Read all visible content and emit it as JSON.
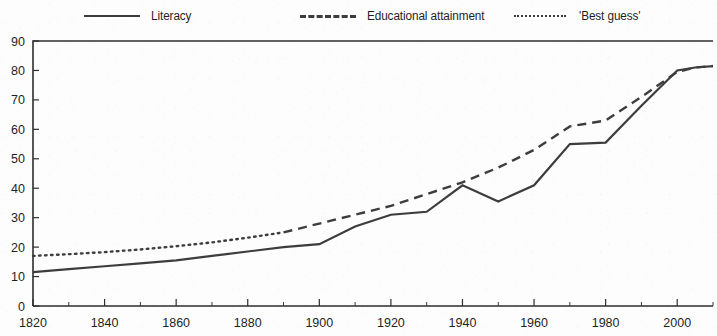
{
  "legend": {
    "items": [
      {
        "label": "Literacy",
        "style": "solid",
        "icon": "solid-line-swatch"
      },
      {
        "label": "Educational attainment",
        "style": "dashed",
        "icon": "dashed-line-swatch"
      },
      {
        "label": "'Best guess'",
        "style": "dotted",
        "icon": "dotted-line-swatch"
      }
    ]
  },
  "chart_data": {
    "type": "line",
    "title": "",
    "subtitle": "",
    "xlabel": "",
    "ylabel": "",
    "xlim": [
      1820,
      2010
    ],
    "ylim": [
      0,
      90
    ],
    "grid": false,
    "legend_position": "top",
    "y_ticks": [
      0,
      10,
      20,
      30,
      40,
      50,
      60,
      70,
      80,
      90
    ],
    "y_tick_labels": [
      "0",
      "10",
      "20",
      "30",
      "40",
      "50",
      "60",
      "70",
      "80",
      "90"
    ],
    "x_ticks": [
      1820,
      1840,
      1860,
      1880,
      1900,
      1920,
      1940,
      1960,
      1980,
      2000
    ],
    "x_tick_labels": [
      "1820",
      "1840",
      "1860",
      "1880",
      "1900",
      "1920",
      "1940",
      "1960",
      "1980",
      "2000"
    ],
    "x_minor_tick_step": 10,
    "series": [
      {
        "name": "Literacy",
        "style": "solid",
        "x": [
          1820,
          1830,
          1840,
          1850,
          1860,
          1870,
          1880,
          1890,
          1900,
          1910,
          1920,
          1930,
          1940,
          1950,
          1960,
          1970,
          1980,
          1990,
          2000,
          2005,
          2010
        ],
        "values": [
          11.5,
          12.5,
          13.5,
          14.5,
          15.5,
          17,
          18.5,
          20,
          21,
          27,
          31,
          32,
          41,
          35.5,
          41,
          55,
          55.5,
          68,
          80,
          81,
          81.5
        ]
      },
      {
        "name": "Educational attainment",
        "style": "dashed",
        "x": [
          1890,
          1900,
          1910,
          1920,
          1930,
          1940,
          1950,
          1960,
          1970,
          1980,
          1990,
          2000,
          2005,
          2010
        ],
        "values": [
          25,
          28,
          31,
          34,
          38,
          42,
          47,
          53,
          61,
          63,
          71,
          79.5,
          81,
          81.5
        ]
      },
      {
        "name": "'Best guess'",
        "style": "dotted",
        "x": [
          1820,
          1830,
          1840,
          1850,
          1860,
          1870,
          1880,
          1890
        ],
        "values": [
          17,
          17.6,
          18.3,
          19.2,
          20.3,
          21.6,
          23.2,
          25
        ]
      }
    ]
  }
}
